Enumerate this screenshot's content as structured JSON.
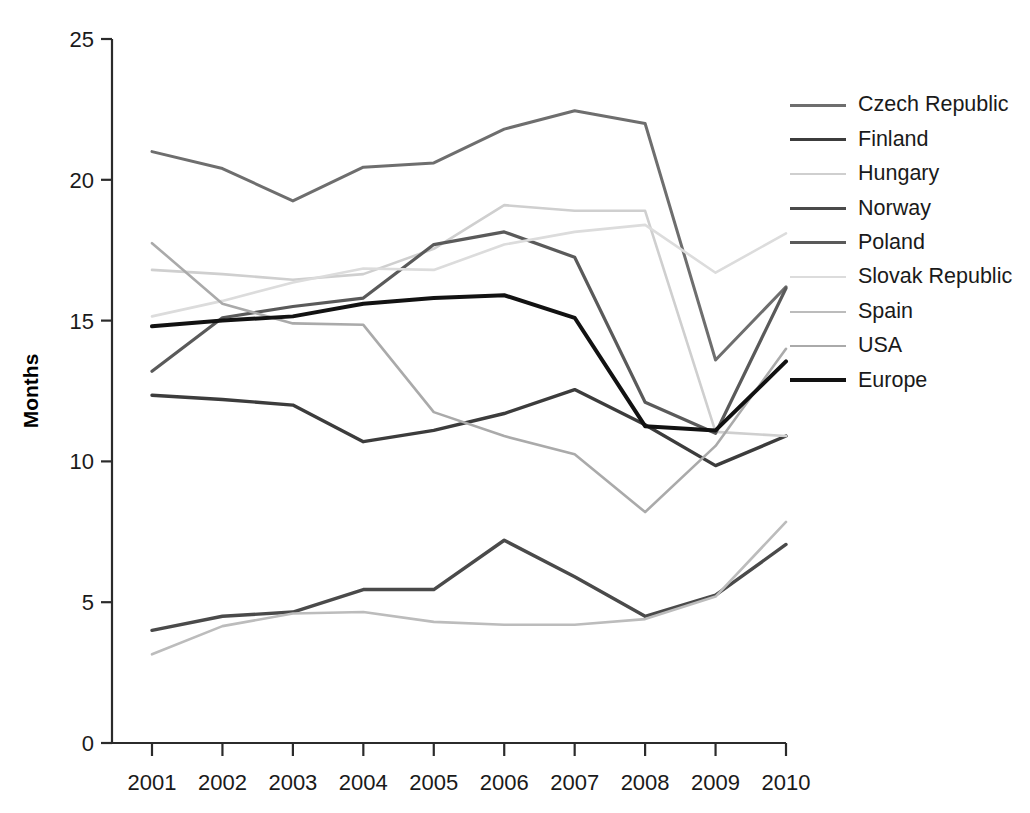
{
  "chart_data": {
    "type": "line",
    "title": "",
    "xlabel": "",
    "ylabel": "Months",
    "x": [
      "2001",
      "2002",
      "2003",
      "2004",
      "2005",
      "2006",
      "2007",
      "2008",
      "2009",
      "2010"
    ],
    "categories": [
      "2001",
      "2002",
      "2003",
      "2004",
      "2005",
      "2006",
      "2007",
      "2008",
      "2009",
      "2010"
    ],
    "xticklabels": [
      "2001",
      "2002",
      "2003",
      "2004",
      "2005",
      "2006",
      "2007",
      "2008",
      "2009",
      "2010"
    ],
    "yticklabels": [
      "0",
      "5",
      "10",
      "15",
      "20",
      "25"
    ],
    "yticks": [
      0,
      5,
      10,
      15,
      20,
      25
    ],
    "ylim": [
      0,
      25
    ],
    "grid": false,
    "legend_position": "right",
    "series": [
      {
        "name": "Czech Republic",
        "color": "#6e6e6e",
        "width": 3.0,
        "values": [
          21.0,
          20.4,
          19.25,
          20.45,
          20.6,
          21.8,
          22.45,
          22.0,
          13.6,
          16.2
        ]
      },
      {
        "name": "Finland",
        "color": "#3c3c3c",
        "width": 3.4,
        "values": [
          12.35,
          12.2,
          12.0,
          10.7,
          11.1,
          11.7,
          12.55,
          11.3,
          9.85,
          10.9
        ]
      },
      {
        "name": "Hungary",
        "color": "#cfcfcf",
        "width": 2.6,
        "values": [
          16.8,
          16.65,
          16.45,
          16.65,
          17.55,
          19.1,
          18.9,
          18.9,
          11.05,
          10.9
        ]
      },
      {
        "name": "Norway",
        "color": "#4a4a4a",
        "width": 3.4,
        "values": [
          4.0,
          4.5,
          4.65,
          5.45,
          5.45,
          7.2,
          5.9,
          4.5,
          5.25,
          7.05
        ]
      },
      {
        "name": "Poland",
        "color": "#5a5a5a",
        "width": 3.2,
        "values": [
          13.2,
          15.1,
          15.5,
          15.8,
          17.7,
          18.15,
          17.25,
          12.1,
          11.0,
          16.15
        ]
      },
      {
        "name": "Slovak Republic",
        "color": "#dcdcdc",
        "width": 2.6,
        "values": [
          15.15,
          15.7,
          16.35,
          16.85,
          16.8,
          17.7,
          18.15,
          18.4,
          16.7,
          18.1
        ]
      },
      {
        "name": "Spain",
        "color": "#bcbcbc",
        "width": 2.6,
        "values": [
          3.15,
          4.15,
          4.6,
          4.65,
          4.3,
          4.2,
          4.2,
          4.4,
          5.2,
          7.85
        ]
      },
      {
        "name": "USA",
        "color": "#aaaaaa",
        "width": 2.6,
        "values": [
          17.75,
          15.6,
          14.9,
          14.85,
          11.75,
          10.9,
          10.25,
          8.2,
          10.55,
          14.0
        ]
      },
      {
        "name": "Europe",
        "color": "#121212",
        "width": 4.0,
        "values": [
          14.8,
          15.0,
          15.15,
          15.6,
          15.8,
          15.9,
          15.1,
          11.25,
          11.1,
          13.55
        ]
      }
    ]
  },
  "axis": {
    "y_title": "Months"
  },
  "legend": {
    "items": [
      {
        "label": "Czech Republic"
      },
      {
        "label": "Finland"
      },
      {
        "label": "Hungary"
      },
      {
        "label": "Norway"
      },
      {
        "label": "Poland"
      },
      {
        "label": "Slovak Republic"
      },
      {
        "label": "Spain"
      },
      {
        "label": "USA"
      },
      {
        "label": "Europe"
      }
    ]
  }
}
